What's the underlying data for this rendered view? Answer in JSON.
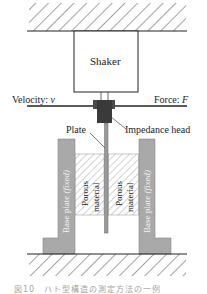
{
  "diagram": {
    "components": {
      "shaker": "Shaker",
      "velocity": "Velocity: ",
      "velocity_symbol": "v",
      "force": "Force: ",
      "force_symbol": "F",
      "plate": "Plate",
      "impedance_head": "Impedance head",
      "porous_left_line1": "Porous",
      "porous_left_line2": "material",
      "porous_right_line1": "Porous",
      "porous_right_line2": "material",
      "base_plate_left": "Base plate ",
      "base_plate_left_fixed": "(fixed)",
      "base_plate_right": "Base plate ",
      "base_plate_right_fixed": "(fixed)"
    },
    "colors": {
      "line": "#222222",
      "base_plate_fill": "#a9a9a9",
      "impedance_head_fill": "#3a3a3a",
      "rod_fill": "#9a9a9a",
      "hatch": "#555555"
    },
    "caption": "図10　ハト型構造の測定方法の一例"
  }
}
